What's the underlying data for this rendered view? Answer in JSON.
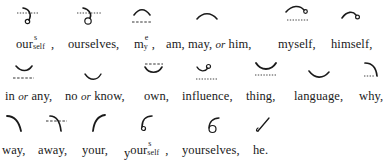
{
  "rows": [
    {
      "entries": [
        {
          "glyph": "ourself-outline-icon",
          "word": "our",
          "sup": "s",
          "sub": "self",
          "punct": ","
        },
        {
          "glyph": "ourselves-outline-icon",
          "word": "ourselves",
          "punct": ","
        },
        {
          "glyph": "me-my-outline-icon",
          "word": "m",
          "sup": "e",
          "sub": "y",
          "punct": ","
        },
        {
          "glyph": "am-may-him-outline-icon",
          "word": "am, may,",
          "conj": "or",
          "word2": "him",
          "punct": ","
        },
        {
          "glyph": "myself-outline-icon",
          "word": "myself",
          "punct": ","
        },
        {
          "glyph": "himself-outline-icon",
          "word": "himself",
          "punct": ","
        }
      ]
    },
    {
      "entries": [
        {
          "glyph": "in-any-outline-icon",
          "word": "in",
          "conj": "or",
          "word2": "any",
          "punct": ","
        },
        {
          "glyph": "no-know-outline-icon",
          "word": "no",
          "conj": "or",
          "word2": "know",
          "punct": ","
        },
        {
          "glyph": "own-outline-icon",
          "word": "own",
          "punct": ","
        },
        {
          "glyph": "influence-outline-icon",
          "word": "influence",
          "punct": ","
        },
        {
          "glyph": "thing-outline-icon",
          "word": "thing",
          "punct": ","
        },
        {
          "glyph": "language-outline-icon",
          "word": "language",
          "punct": ","
        },
        {
          "glyph": "why-outline-icon",
          "word": "why",
          "punct": ","
        }
      ]
    },
    {
      "entries": [
        {
          "glyph": "way-outline-icon",
          "word": "way",
          "punct": ","
        },
        {
          "glyph": "away-outline-icon",
          "word": "away",
          "punct": ","
        },
        {
          "glyph": "your-outline-icon",
          "word": "your",
          "punct": ","
        },
        {
          "glyph": "yourself-outline-icon",
          "prefix": "y",
          "word": "our",
          "sup": "s",
          "sub": "self",
          "punct": ","
        },
        {
          "glyph": "yourselves-outline-icon",
          "word": "yourselves",
          "punct": ","
        },
        {
          "glyph": "he-outline-icon",
          "word": "he",
          "punct": "."
        }
      ]
    }
  ],
  "labels": {
    "r1": [
      "our",
      "s",
      "self",
      ",",
      "ourselves,",
      "m",
      "e",
      "y",
      ",",
      "am, may,",
      "or",
      "him,",
      "myself,",
      "himself,"
    ],
    "r2": [
      "in",
      "or",
      "any,",
      "no",
      "or",
      "know,",
      "own,",
      "influence,",
      "thing,",
      "language,",
      "why,"
    ],
    "r3": [
      "way,",
      "away,",
      "your,",
      "y",
      "our",
      "s",
      "self",
      ",",
      "yourselves,",
      "he."
    ]
  },
  "colors": {
    "ink": "#1a1a1a",
    "paper": "#ffffff"
  }
}
